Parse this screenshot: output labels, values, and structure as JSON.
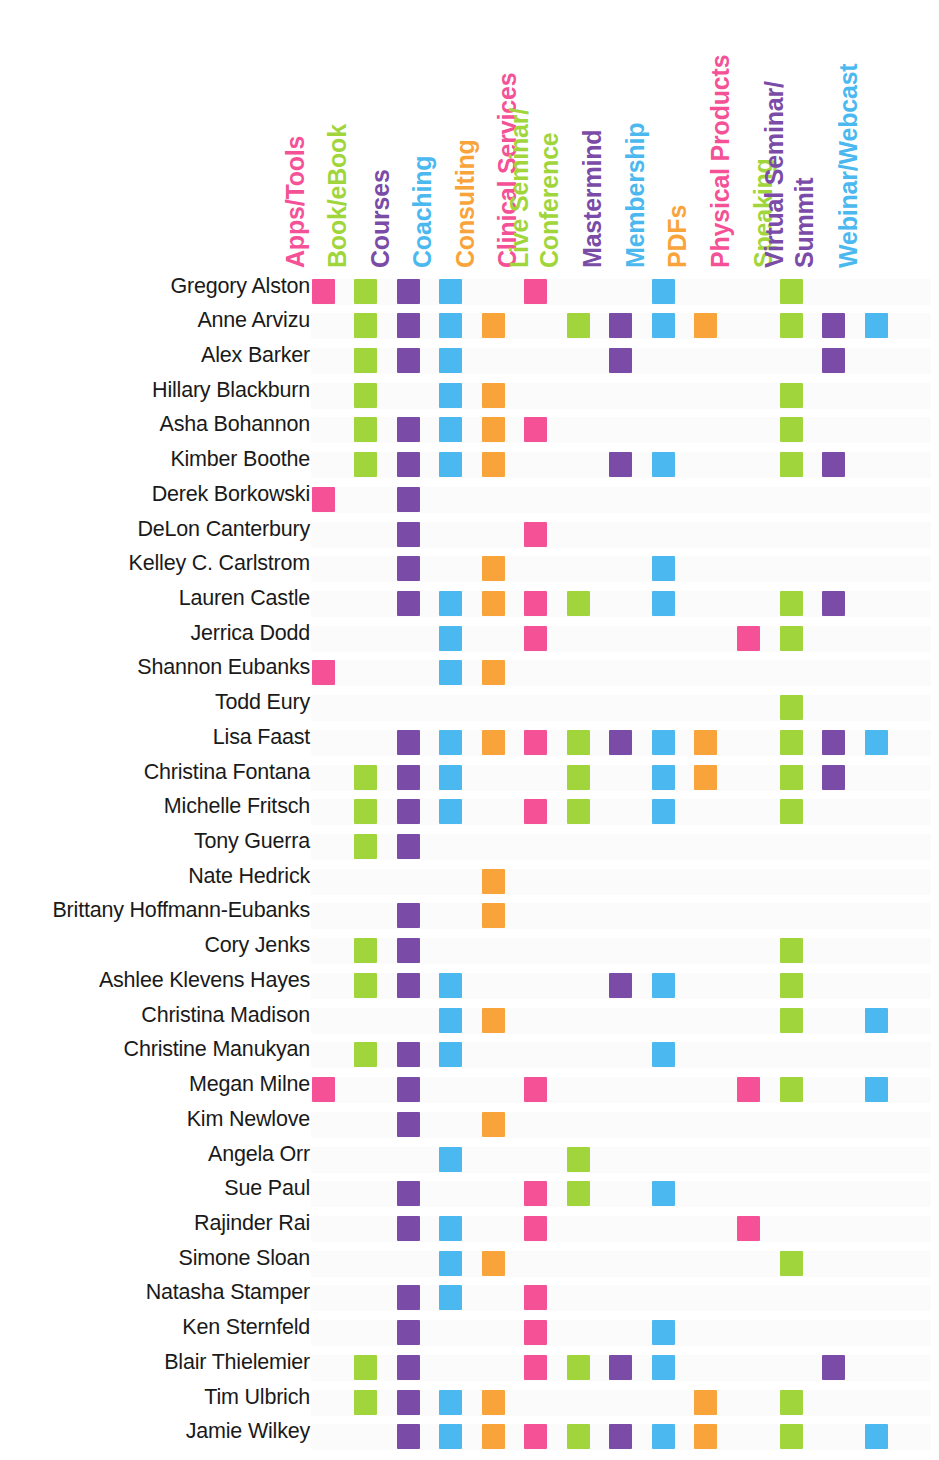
{
  "colors": {
    "pink": "#F45197",
    "green": "#A0D63C",
    "purple": "#7B4BA8",
    "blue": "#4BB8F0",
    "orange": "#F9A43A",
    "text": "#1a1a1a",
    "background": "#ffffff"
  },
  "columns": [
    {
      "label": "Apps/Tools",
      "color": "#F45197",
      "lines": [
        "Apps/Tools"
      ]
    },
    {
      "label": "Book/eBook",
      "color": "#A0D63C",
      "lines": [
        "Book/eBook"
      ]
    },
    {
      "label": "Courses",
      "color": "#7B4BA8",
      "lines": [
        "Courses"
      ]
    },
    {
      "label": "Coaching",
      "color": "#4BB8F0",
      "lines": [
        "Coaching"
      ]
    },
    {
      "label": "Consulting",
      "color": "#F9A43A",
      "lines": [
        "Consulting"
      ]
    },
    {
      "label": "Clinical Services",
      "color": "#F45197",
      "lines": [
        "Clinical Services"
      ]
    },
    {
      "label": "Live Seminar/ Conference",
      "color": "#A0D63C",
      "lines": [
        "Live Seminar/",
        "Conference"
      ]
    },
    {
      "label": "Mastermind",
      "color": "#7B4BA8",
      "lines": [
        "Mastermind"
      ]
    },
    {
      "label": "Membership",
      "color": "#4BB8F0",
      "lines": [
        "Membership"
      ]
    },
    {
      "label": "PDFs",
      "color": "#F9A43A",
      "lines": [
        "PDFs"
      ]
    },
    {
      "label": "Physical Products",
      "color": "#F45197",
      "lines": [
        "Physical Products"
      ]
    },
    {
      "label": "Speaking",
      "color": "#A0D63C",
      "lines": [
        "Speaking"
      ]
    },
    {
      "label": "Virtual Seminar/ Summit",
      "color": "#7B4BA8",
      "lines": [
        "Virtual Seminar/",
        "Summit"
      ]
    },
    {
      "label": "Webinar/Webcast",
      "color": "#4BB8F0",
      "lines": [
        "Webinar/Webcast"
      ]
    }
  ],
  "rows": [
    {
      "name": "Gregory Alston",
      "cells": [
        1,
        2,
        3,
        4,
        6,
        9,
        12
      ]
    },
    {
      "name": "Anne Arvizu",
      "cells": [
        2,
        3,
        4,
        5,
        7,
        8,
        9,
        10,
        12,
        13,
        14
      ]
    },
    {
      "name": "Alex Barker",
      "cells": [
        2,
        3,
        4,
        8,
        13
      ]
    },
    {
      "name": "Hillary Blackburn",
      "cells": [
        2,
        4,
        5,
        12
      ]
    },
    {
      "name": "Asha Bohannon",
      "cells": [
        2,
        3,
        4,
        5,
        6,
        12
      ]
    },
    {
      "name": "Kimber Boothe",
      "cells": [
        2,
        3,
        4,
        5,
        8,
        9,
        12,
        13
      ]
    },
    {
      "name": "Derek Borkowski",
      "cells": [
        1,
        3
      ]
    },
    {
      "name": "DeLon Canterbury",
      "cells": [
        3,
        6
      ]
    },
    {
      "name": "Kelley C. Carlstrom",
      "cells": [
        3,
        5,
        9
      ]
    },
    {
      "name": "Lauren Castle",
      "cells": [
        3,
        4,
        5,
        6,
        7,
        9,
        12,
        13
      ]
    },
    {
      "name": "Jerrica Dodd",
      "cells": [
        4,
        6,
        11,
        12
      ]
    },
    {
      "name": "Shannon Eubanks",
      "cells": [
        1,
        4,
        5
      ]
    },
    {
      "name": "Todd Eury",
      "cells": [
        12
      ]
    },
    {
      "name": "Lisa Faast",
      "cells": [
        3,
        4,
        5,
        6,
        7,
        8,
        9,
        10,
        12,
        13,
        14
      ]
    },
    {
      "name": "Christina Fontana",
      "cells": [
        2,
        3,
        4,
        7,
        9,
        10,
        12,
        13
      ]
    },
    {
      "name": "Michelle Fritsch",
      "cells": [
        2,
        3,
        4,
        6,
        7,
        9,
        12
      ]
    },
    {
      "name": "Tony Guerra",
      "cells": [
        2,
        3
      ]
    },
    {
      "name": "Nate Hedrick",
      "cells": [
        5
      ]
    },
    {
      "name": "Brittany Hoffmann-Eubanks",
      "cells": [
        3,
        5
      ]
    },
    {
      "name": "Cory Jenks",
      "cells": [
        2,
        3,
        12
      ]
    },
    {
      "name": "Ashlee Klevens Hayes",
      "cells": [
        2,
        3,
        4,
        8,
        9,
        12
      ]
    },
    {
      "name": "Christina Madison",
      "cells": [
        4,
        5,
        12,
        14
      ]
    },
    {
      "name": "Christine Manukyan",
      "cells": [
        2,
        3,
        4,
        9
      ]
    },
    {
      "name": "Megan Milne",
      "cells": [
        1,
        3,
        6,
        11,
        12,
        14
      ]
    },
    {
      "name": "Kim Newlove",
      "cells": [
        3,
        5
      ]
    },
    {
      "name": "Angela Orr",
      "cells": [
        4,
        7
      ]
    },
    {
      "name": "Sue Paul",
      "cells": [
        3,
        6,
        7,
        9
      ]
    },
    {
      "name": "Rajinder Rai",
      "cells": [
        3,
        4,
        6,
        11
      ]
    },
    {
      "name": "Simone Sloan",
      "cells": [
        4,
        5,
        12
      ]
    },
    {
      "name": "Natasha Stamper",
      "cells": [
        3,
        4,
        6
      ]
    },
    {
      "name": "Ken Sternfeld",
      "cells": [
        3,
        6,
        9
      ]
    },
    {
      "name": "Blair Thielemier",
      "cells": [
        2,
        3,
        6,
        7,
        8,
        9,
        13
      ]
    },
    {
      "name": "Tim Ulbrich",
      "cells": [
        2,
        3,
        4,
        5,
        10,
        12
      ]
    },
    {
      "name": "Jamie Wilkey",
      "cells": [
        3,
        4,
        5,
        6,
        7,
        8,
        9,
        10,
        12,
        14
      ]
    }
  ],
  "chart_data": {
    "type": "heatmap",
    "xlabel": "",
    "ylabel": "",
    "grid": false,
    "legend": "none",
    "x_categories": [
      "Apps/Tools",
      "Book/eBook",
      "Courses",
      "Coaching",
      "Consulting",
      "Clinical Services",
      "Live Seminar/ Conference",
      "Mastermind",
      "Membership",
      "PDFs",
      "Physical Products",
      "Speaking",
      "Virtual Seminar/ Summit",
      "Webinar/Webcast"
    ],
    "y_categories": [
      "Gregory Alston",
      "Anne Arvizu",
      "Alex Barker",
      "Hillary Blackburn",
      "Asha Bohannon",
      "Kimber Boothe",
      "Derek Borkowski",
      "DeLon Canterbury",
      "Kelley C. Carlstrom",
      "Lauren Castle",
      "Jerrica Dodd",
      "Shannon Eubanks",
      "Todd Eury",
      "Lisa Faast",
      "Christina Fontana",
      "Michelle Fritsch",
      "Tony Guerra",
      "Nate Hedrick",
      "Brittany Hoffmann-Eubanks",
      "Cory Jenks",
      "Ashlee Klevens Hayes",
      "Christina Madison",
      "Christine Manukyan",
      "Megan Milne",
      "Kim Newlove",
      "Angela Orr",
      "Sue Paul",
      "Rajinder Rai",
      "Simone Sloan",
      "Natasha Stamper",
      "Ken Sternfeld",
      "Blair Thielemier",
      "Tim Ulbrich",
      "Jamie Wilkey"
    ],
    "values": [
      [
        1,
        1,
        1,
        1,
        0,
        1,
        0,
        0,
        1,
        0,
        0,
        1,
        0,
        0
      ],
      [
        0,
        1,
        1,
        1,
        1,
        0,
        1,
        1,
        1,
        1,
        0,
        1,
        1,
        1
      ],
      [
        0,
        1,
        1,
        1,
        0,
        0,
        0,
        1,
        0,
        0,
        0,
        0,
        1,
        0
      ],
      [
        0,
        1,
        0,
        1,
        1,
        0,
        0,
        0,
        0,
        0,
        0,
        1,
        0,
        0
      ],
      [
        0,
        1,
        1,
        1,
        1,
        1,
        0,
        0,
        0,
        0,
        0,
        1,
        0,
        0
      ],
      [
        0,
        1,
        1,
        1,
        1,
        0,
        0,
        1,
        1,
        0,
        0,
        1,
        1,
        0
      ],
      [
        1,
        0,
        1,
        0,
        0,
        0,
        0,
        0,
        0,
        0,
        0,
        0,
        0,
        0
      ],
      [
        0,
        0,
        1,
        0,
        0,
        1,
        0,
        0,
        0,
        0,
        0,
        0,
        0,
        0
      ],
      [
        0,
        0,
        1,
        0,
        1,
        0,
        0,
        0,
        1,
        0,
        0,
        0,
        0,
        0
      ],
      [
        0,
        0,
        1,
        1,
        1,
        1,
        1,
        0,
        1,
        0,
        0,
        1,
        1,
        0
      ],
      [
        0,
        0,
        0,
        1,
        0,
        1,
        0,
        0,
        0,
        0,
        1,
        1,
        0,
        0
      ],
      [
        1,
        0,
        0,
        1,
        1,
        0,
        0,
        0,
        0,
        0,
        0,
        0,
        0,
        0
      ],
      [
        0,
        0,
        0,
        0,
        0,
        0,
        0,
        0,
        0,
        0,
        0,
        1,
        0,
        0
      ],
      [
        0,
        0,
        1,
        1,
        1,
        1,
        1,
        1,
        1,
        1,
        0,
        1,
        1,
        1
      ],
      [
        0,
        1,
        1,
        1,
        0,
        0,
        1,
        0,
        1,
        1,
        0,
        1,
        1,
        0
      ],
      [
        0,
        1,
        1,
        1,
        0,
        1,
        1,
        0,
        1,
        0,
        0,
        1,
        0,
        0
      ],
      [
        0,
        1,
        1,
        0,
        0,
        0,
        0,
        0,
        0,
        0,
        0,
        0,
        0,
        0
      ],
      [
        0,
        0,
        0,
        0,
        1,
        0,
        0,
        0,
        0,
        0,
        0,
        0,
        0,
        0
      ],
      [
        0,
        0,
        1,
        0,
        1,
        0,
        0,
        0,
        0,
        0,
        0,
        0,
        0,
        0
      ],
      [
        0,
        1,
        1,
        0,
        0,
        0,
        0,
        0,
        0,
        0,
        0,
        1,
        0,
        0
      ],
      [
        0,
        1,
        1,
        1,
        0,
        0,
        0,
        1,
        1,
        0,
        0,
        1,
        0,
        0
      ],
      [
        0,
        0,
        0,
        1,
        1,
        0,
        0,
        0,
        0,
        0,
        0,
        1,
        0,
        1
      ],
      [
        0,
        1,
        1,
        1,
        0,
        0,
        0,
        0,
        1,
        0,
        0,
        0,
        0,
        0
      ],
      [
        1,
        0,
        1,
        0,
        0,
        1,
        0,
        0,
        0,
        0,
        1,
        1,
        0,
        1
      ],
      [
        0,
        0,
        1,
        0,
        1,
        0,
        0,
        0,
        0,
        0,
        0,
        0,
        0,
        0
      ],
      [
        0,
        0,
        0,
        1,
        0,
        0,
        1,
        0,
        0,
        0,
        0,
        0,
        0,
        0
      ],
      [
        0,
        0,
        1,
        0,
        0,
        1,
        1,
        0,
        1,
        0,
        0,
        0,
        0,
        0
      ],
      [
        0,
        0,
        1,
        1,
        0,
        1,
        0,
        0,
        0,
        0,
        1,
        0,
        0,
        0
      ],
      [
        0,
        0,
        0,
        1,
        1,
        0,
        0,
        0,
        0,
        0,
        0,
        1,
        0,
        0
      ],
      [
        0,
        0,
        1,
        1,
        0,
        1,
        0,
        0,
        0,
        0,
        0,
        0,
        0,
        0
      ],
      [
        0,
        0,
        1,
        0,
        0,
        1,
        0,
        0,
        1,
        0,
        0,
        0,
        0,
        0
      ],
      [
        0,
        1,
        1,
        0,
        0,
        1,
        1,
        1,
        1,
        0,
        0,
        0,
        1,
        0
      ],
      [
        0,
        1,
        1,
        1,
        1,
        0,
        0,
        0,
        0,
        1,
        0,
        1,
        0,
        0
      ],
      [
        0,
        0,
        1,
        1,
        1,
        1,
        1,
        1,
        1,
        1,
        0,
        1,
        0,
        1
      ]
    ]
  }
}
